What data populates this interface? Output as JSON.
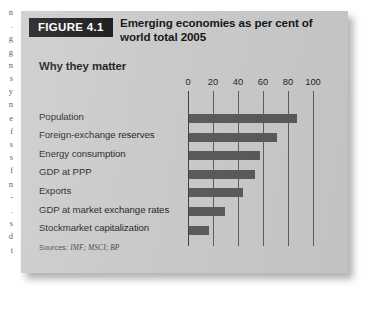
{
  "figure": {
    "badge": "FIGURE 4.1",
    "title": "Emerging economies as per cent of world total 2005",
    "subtitle": "Why they matter",
    "sources_lead": "Sources:",
    "sources_text": "IMF; MSCI; BP"
  },
  "colors": {
    "card_background": "#c9c9c9",
    "badge_background": "#111111",
    "badge_text": "#ffffff",
    "bar_fill": "#585858",
    "gridline": "#5c5c5c",
    "axis": "#3d3d3d",
    "page_background": "#ffffff",
    "label_text": "#1d1d1d"
  },
  "chart_data": {
    "type": "bar",
    "orientation": "horizontal",
    "title": "Emerging economies as per cent of world total 2005",
    "subtitle": "Why they matter",
    "xlabel": "",
    "ylabel": "",
    "xlim": [
      0,
      100
    ],
    "xticks": [
      0,
      20,
      40,
      60,
      80,
      100
    ],
    "xtick_labels": [
      "0",
      "20",
      "40",
      "60",
      "80",
      "100"
    ],
    "grid": true,
    "legend": false,
    "categories": [
      "Population",
      "Foreign-exchange reserves",
      "Energy consumption",
      "GDP at PPP",
      "Exports",
      "GDP at market exchange rates",
      "Stockmarket capitalization"
    ],
    "values": [
      86,
      70,
      57,
      53,
      43,
      29,
      16
    ],
    "units": "per cent of world total",
    "sources": "Sources: IMF; MSCI; BP"
  },
  "edge_column_fragments": [
    "n",
    ".",
    "g",
    "g",
    "n",
    "s",
    "y",
    "n",
    "e",
    "f",
    "s",
    "s",
    "f",
    "n",
    "-",
    ".",
    "s",
    "d",
    "t"
  ]
}
